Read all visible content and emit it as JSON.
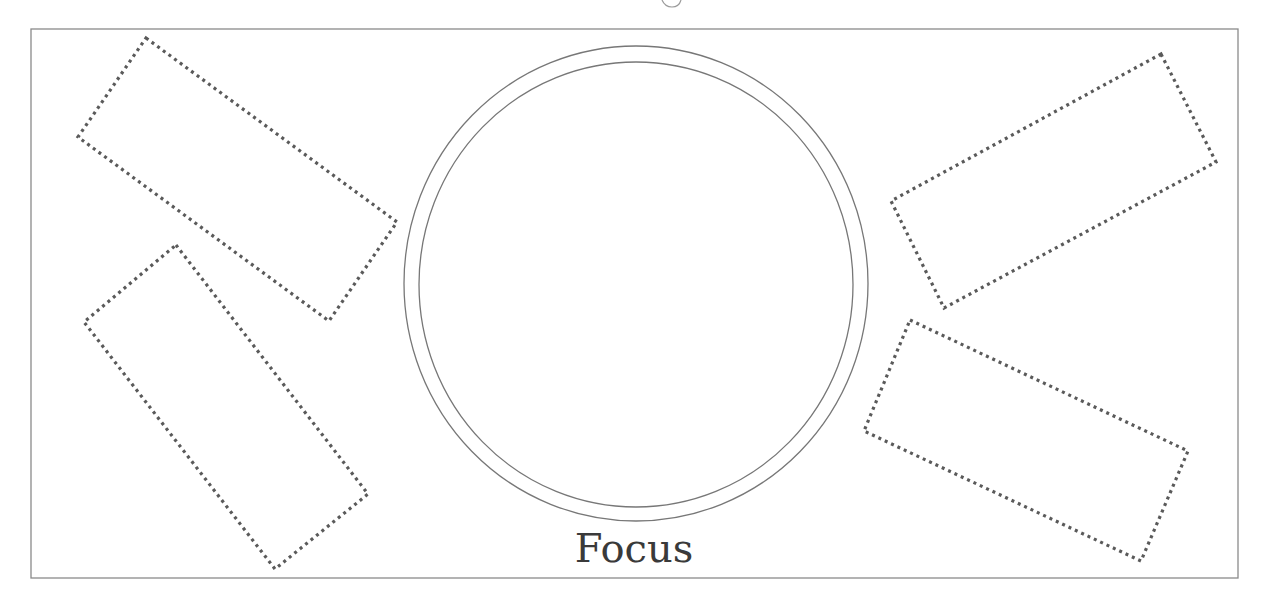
{
  "diagram": {
    "center_label": "Focus",
    "colors": {
      "frame": "#8a8a8a",
      "ring": "#777777",
      "dotted_boxes": "#5a5a5a",
      "label": "#3a3a3a",
      "background": "#ffffff"
    },
    "frame": {
      "x": 31,
      "y": 29,
      "width": 1207,
      "height": 549
    },
    "outer_ring": {
      "cx": 636,
      "cy": 283.5,
      "rx": 232,
      "ry": 237.5
    },
    "inner_ring": {
      "cx": 636,
      "cy": 284.5,
      "rx": 217,
      "ry": 222.5
    },
    "dotted_boxes": [
      {
        "id": "upper-left",
        "points": "146,38 397,222 329,321 78,137"
      },
      {
        "id": "lower-left",
        "points": "176,245 368,494 275,569 84,322"
      },
      {
        "id": "upper-right",
        "points": "1161,54 1216,162 944,308 891,201"
      },
      {
        "id": "lower-right",
        "points": "910,320 1188,451 1141,561 864,431"
      }
    ]
  }
}
